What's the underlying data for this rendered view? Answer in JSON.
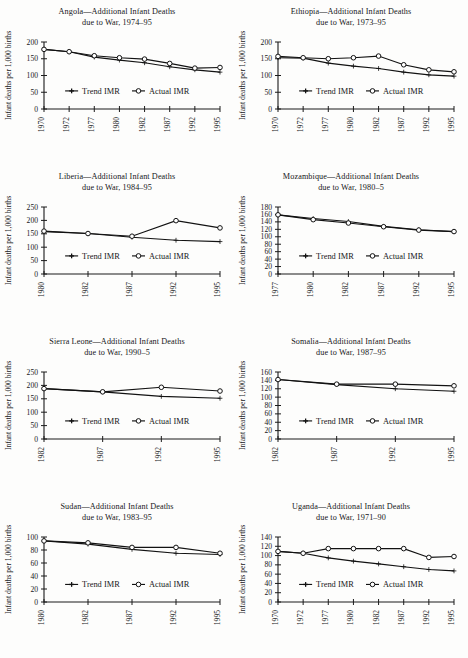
{
  "figure": {
    "kind": "small-multiples-line-charts",
    "panel_count": 8,
    "legend_labels": [
      "Trend IMR",
      "Actual IMR"
    ],
    "shared_ylabel": "Infant deaths per 1,000 births",
    "accent_color": "#121212",
    "background_color": "#fdfdfc"
  },
  "chart_data": [
    {
      "type": "line",
      "title": "Angola—Additional Infant Deaths",
      "subtitle": "due to War, 1974–95",
      "xlabel": "",
      "ylabel": "Infant deaths per 1,000 births",
      "categories": [
        "1970",
        "1972",
        "1977",
        "1980",
        "1982",
        "1987",
        "1992",
        "1995"
      ],
      "ylim": [
        0,
        200
      ],
      "yticks": [
        0,
        50,
        100,
        150,
        200
      ],
      "grid": false,
      "legend_position": "inside-lower-left",
      "series": [
        {
          "name": "Trend IMR",
          "marker": "filled",
          "values": [
            178,
            171,
            155,
            146,
            138,
            126,
            117,
            110
          ]
        },
        {
          "name": "Actual IMR",
          "marker": "open",
          "values": [
            178,
            171,
            159,
            153,
            149,
            136,
            122,
            124
          ]
        }
      ]
    },
    {
      "type": "line",
      "title": "Ethiopia—Additional Infant Deaths",
      "subtitle": "due to War, 1973–95",
      "xlabel": "",
      "ylabel": "Infant deaths per 1,000 births",
      "categories": [
        "1970",
        "1972",
        "1977",
        "1980",
        "1982",
        "1987",
        "1992",
        "1995"
      ],
      "ylim": [
        0,
        200
      ],
      "yticks": [
        0,
        50,
        100,
        150,
        200
      ],
      "grid": false,
      "legend_position": "inside-lower-left",
      "series": [
        {
          "name": "Trend IMR",
          "marker": "filled",
          "values": [
            153,
            152,
            137,
            128,
            121,
            110,
            102,
            98
          ]
        },
        {
          "name": "Actual IMR",
          "marker": "open",
          "values": [
            157,
            153,
            150,
            153,
            158,
            132,
            117,
            111
          ]
        }
      ]
    },
    {
      "type": "line",
      "title": "Liberia—Additional Infant Deaths",
      "subtitle": "due to War, 1984–95",
      "xlabel": "",
      "ylabel": "Infant deaths per 1,000 births",
      "categories": [
        "1980",
        "1982",
        "1987",
        "1992",
        "1995"
      ],
      "ylim": [
        0,
        250
      ],
      "yticks": [
        0,
        50,
        100,
        150,
        200,
        250
      ],
      "grid": false,
      "legend_position": "inside-lower-left",
      "series": [
        {
          "name": "Trend IMR",
          "marker": "filled",
          "values": [
            158,
            151,
            137,
            126,
            121
          ]
        },
        {
          "name": "Actual IMR",
          "marker": "open",
          "values": [
            160,
            151,
            141,
            199,
            172
          ]
        }
      ]
    },
    {
      "type": "line",
      "title": "Mozambique—Additional Infant Deaths",
      "subtitle": "due to War, 1980–5",
      "xlabel": "",
      "ylabel": "Infant deaths per 1,000 births",
      "categories": [
        "1977",
        "1980",
        "1982",
        "1987",
        "1992",
        "1995"
      ],
      "ylim": [
        0,
        180
      ],
      "yticks": [
        0,
        20,
        40,
        60,
        80,
        100,
        120,
        140,
        160,
        180
      ],
      "grid": false,
      "legend_position": "inside-lower-left",
      "series": [
        {
          "name": "Trend IMR",
          "marker": "filled",
          "values": [
            159,
            149,
            141,
            128,
            119,
            114
          ]
        },
        {
          "name": "Actual IMR",
          "marker": "open",
          "values": [
            159,
            146,
            137,
            127,
            118,
            114
          ]
        }
      ]
    },
    {
      "type": "line",
      "title": "Sierra Leone—Additional Infant Deaths",
      "subtitle": "due to War, 1990–5",
      "xlabel": "",
      "ylabel": "Infant deaths per 1,000 births",
      "categories": [
        "1982",
        "1987",
        "1992",
        "1995"
      ],
      "ylim": [
        0,
        250
      ],
      "yticks": [
        0,
        50,
        100,
        150,
        200,
        250
      ],
      "grid": false,
      "legend_position": "inside-lower-left",
      "series": [
        {
          "name": "Trend IMR",
          "marker": "filled",
          "values": [
            188,
            176,
            159,
            152
          ]
        },
        {
          "name": "Actual IMR",
          "marker": "open",
          "values": [
            188,
            176,
            193,
            179
          ]
        }
      ]
    },
    {
      "type": "line",
      "title": "Somalia—Additional Infant Deaths",
      "subtitle": "due to War, 1987–95",
      "xlabel": "",
      "ylabel": "Infant deaths per 1,000 births",
      "categories": [
        "1982",
        "1987",
        "1992",
        "1995"
      ],
      "ylim": [
        0,
        160
      ],
      "yticks": [
        0,
        20,
        40,
        60,
        80,
        100,
        120,
        140,
        160
      ],
      "grid": false,
      "legend_position": "inside-lower-left",
      "series": [
        {
          "name": "Trend IMR",
          "marker": "filled",
          "values": [
            142,
            130,
            120,
            114
          ]
        },
        {
          "name": "Actual IMR",
          "marker": "open",
          "values": [
            142,
            131,
            131,
            127
          ]
        }
      ]
    },
    {
      "type": "line",
      "title": "Sudan—Additional Infant Deaths",
      "subtitle": "due to War, 1983–95",
      "xlabel": "",
      "ylabel": "Infant deaths per 1,000 births",
      "categories": [
        "1980",
        "1982",
        "1987",
        "1992",
        "1995"
      ],
      "ylim": [
        0,
        100
      ],
      "yticks": [
        0,
        20,
        40,
        60,
        80,
        100
      ],
      "grid": false,
      "legend_position": "inside-lower-left",
      "series": [
        {
          "name": "Trend IMR",
          "marker": "filled",
          "values": [
            94,
            89,
            81,
            75,
            73
          ]
        },
        {
          "name": "Actual IMR",
          "marker": "open",
          "values": [
            94,
            91,
            84,
            84,
            75
          ]
        }
      ]
    },
    {
      "type": "line",
      "title": "Uganda—Additional Infant Deaths",
      "subtitle": "due to War, 1971–90",
      "xlabel": "",
      "ylabel": "Infant deaths per 1,000 births",
      "categories": [
        "1970",
        "1972",
        "1977",
        "1980",
        "1982",
        "1987",
        "1992",
        "1995"
      ],
      "ylim": [
        0,
        140
      ],
      "yticks": [
        0,
        20,
        40,
        60,
        80,
        100,
        120,
        140
      ],
      "grid": false,
      "legend_position": "inside-lower-left",
      "series": [
        {
          "name": "Trend IMR",
          "marker": "filled",
          "values": [
            109,
            105,
            95,
            88,
            82,
            76,
            70,
            67
          ]
        },
        {
          "name": "Actual IMR",
          "marker": "open",
          "values": [
            109,
            105,
            115,
            115,
            115,
            115,
            96,
            98
          ]
        }
      ]
    }
  ]
}
